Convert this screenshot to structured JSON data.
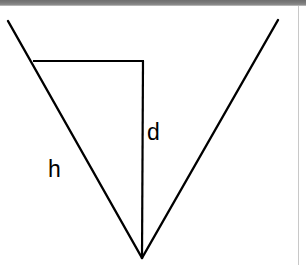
{
  "window": {
    "titlebar_color": "#7b7b7b",
    "background_color": "#ffffff",
    "border_color": "#c8c8c8",
    "width": 306,
    "height": 265
  },
  "figure": {
    "name": "inverted-v-triangle-diagram",
    "stroke_color": "#000000",
    "stroke_width": 2.4,
    "labels": {
      "hypotenuse": "h",
      "depth": "d"
    },
    "geometry": {
      "apex": [
        142,
        252
      ],
      "left_ray_top": [
        8,
        15
      ],
      "right_ray_top": [
        278,
        14
      ],
      "horizontal_left": [
        34,
        55
      ],
      "horizontal_right": [
        143,
        55
      ],
      "vertical_top": [
        143,
        55
      ],
      "vertical_bottom": [
        142,
        252
      ]
    }
  }
}
